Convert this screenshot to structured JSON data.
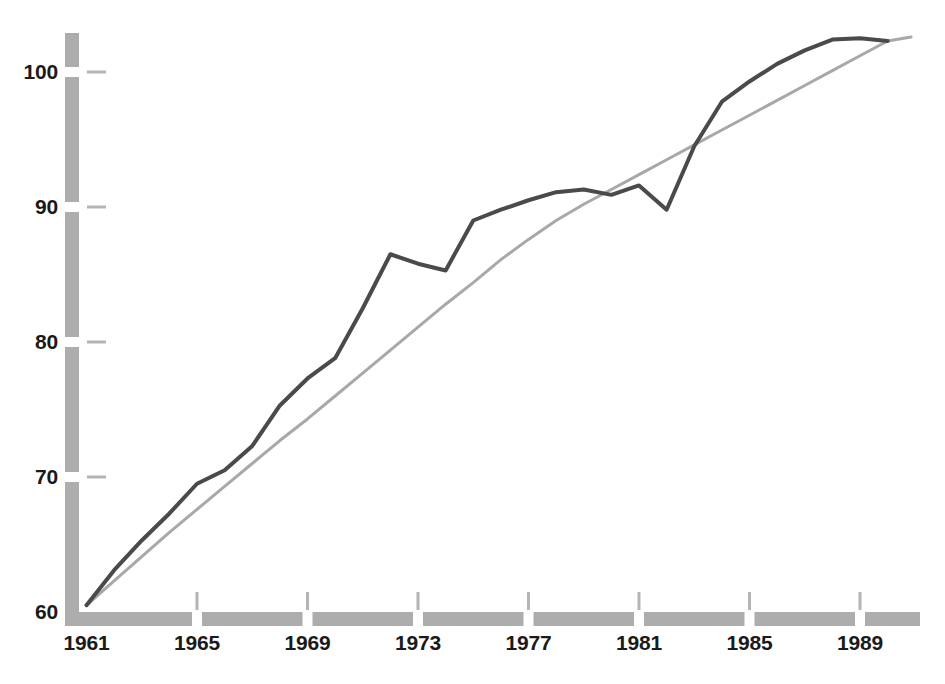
{
  "chart_data": {
    "type": "line",
    "title": "",
    "subtitle": "",
    "xlabel": "",
    "ylabel": "",
    "xlim": [
      1961,
      1990.8
    ],
    "ylim": [
      60,
      103.5
    ],
    "grid": false,
    "legend_position": "none",
    "x_tick_labels": [
      "1961",
      "1965",
      "1969",
      "1973",
      "1977",
      "1981",
      "1985",
      "1989"
    ],
    "x_ticks": [
      1961,
      1965,
      1969,
      1973,
      1977,
      1981,
      1985,
      1989
    ],
    "y_tick_labels": [
      "60",
      "70",
      "80",
      "90",
      "100"
    ],
    "y_ticks": [
      60,
      70,
      80,
      90,
      100
    ],
    "x": [
      1961,
      1962,
      1963,
      1964,
      1965,
      1966,
      1967,
      1968,
      1969,
      1970,
      1971,
      1972,
      1973,
      1974,
      1975,
      1976,
      1977,
      1978,
      1979,
      1980,
      1981,
      1982,
      1983,
      1984,
      1985,
      1986,
      1987,
      1988,
      1989,
      1990
    ],
    "series": [
      {
        "name": "observed",
        "color": "#4a4a4a",
        "line_width": 4,
        "values": [
          60.5,
          63.1,
          65.3,
          67.3,
          69.5,
          70.5,
          72.3,
          75.3,
          77.3,
          78.8,
          82.5,
          86.5,
          85.8,
          85.3,
          89.0,
          89.8,
          90.5,
          91.1,
          91.3,
          90.9,
          91.6,
          89.8,
          94.5,
          97.8,
          99.3,
          100.6,
          101.6,
          102.4,
          102.5,
          102.3
        ]
      },
      {
        "name": "trend",
        "color": "#a8a8a8",
        "line_width": 3,
        "values": [
          60.5,
          62.3,
          64.1,
          65.9,
          67.6,
          69.3,
          71.0,
          72.7,
          74.3,
          76.0,
          77.7,
          79.4,
          81.1,
          82.8,
          84.4,
          86.1,
          87.6,
          89.0,
          90.2,
          91.3,
          92.4,
          93.5,
          94.6,
          95.7,
          96.8,
          97.9,
          99.0,
          100.1,
          101.2,
          102.3
        ]
      }
    ],
    "trend_extension": {
      "x_end": 1990.85,
      "y_end": 102.6
    }
  },
  "axes": {
    "axis_bar_color": "#adadad",
    "tick_mark_color": "#b5b5b5",
    "label_color": "#1a1a1a",
    "y_axis_bar_width": 14,
    "x_axis_bar_height": 14
  }
}
